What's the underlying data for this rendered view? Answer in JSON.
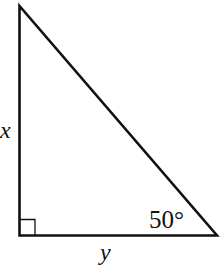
{
  "diagram": {
    "type": "right-triangle",
    "vertical_leg_label": "x",
    "horizontal_leg_label": "y",
    "angle_label": "50°",
    "right_angle_marker": true,
    "stroke_color": "#111111",
    "background": "#ffffff"
  }
}
